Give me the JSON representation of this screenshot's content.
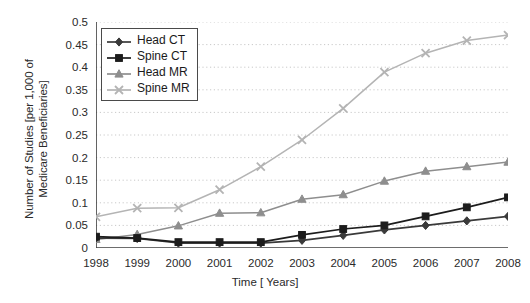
{
  "chart_data": {
    "type": "line",
    "title": "",
    "xlabel": "Time [ Years]",
    "ylabel": "Number of Studies [per 1,000 of Medicare Beneficiaries]",
    "ylabel_line1": "Number of Studies [per 1,000 of",
    "ylabel_line2": "Medicare Beneficiaries]",
    "x": [
      1998,
      1999,
      2000,
      2001,
      2002,
      2003,
      2004,
      2005,
      2006,
      2007,
      2008
    ],
    "categories": [
      "1998",
      "1999",
      "2000",
      "2001",
      "2002",
      "2003",
      "2004",
      "2005",
      "2006",
      "2007",
      "2008"
    ],
    "xlim": [
      1998,
      2008
    ],
    "ylim": [
      0,
      0.5
    ],
    "yticks": [
      0,
      0.05,
      0.1,
      0.15,
      0.2,
      0.25,
      0.3,
      0.35,
      0.4,
      0.45,
      0.5
    ],
    "ytick_labels": [
      "0",
      "0.05",
      "0.1",
      "0.15",
      "0.2",
      "0.25",
      "0.3",
      "0.35",
      "0.4",
      "0.45",
      "0.5"
    ],
    "grid": true,
    "grid_style": "dotted-horizontal",
    "legend_position": "top-left",
    "series": [
      {
        "name": "Head CT",
        "marker": "diamond",
        "color": "#3a3a3a",
        "values": [
          0.022,
          0.021,
          0.011,
          0.011,
          0.011,
          0.017,
          0.028,
          0.04,
          0.05,
          0.06,
          0.07
        ]
      },
      {
        "name": "Spine CT",
        "marker": "square",
        "color": "#1c1c1c",
        "values": [
          0.025,
          0.022,
          0.013,
          0.013,
          0.013,
          0.029,
          0.042,
          0.05,
          0.07,
          0.09,
          0.112
        ]
      },
      {
        "name": "Head MR",
        "marker": "triangle",
        "color": "#8e8e8e",
        "values": [
          0.019,
          0.03,
          0.049,
          0.077,
          0.078,
          0.108,
          0.118,
          0.148,
          0.17,
          0.18,
          0.19
        ]
      },
      {
        "name": "Spine MR",
        "marker": "cross",
        "color": "#b4b4b4",
        "values": [
          0.069,
          0.088,
          0.089,
          0.129,
          0.18,
          0.239,
          0.309,
          0.389,
          0.431,
          0.459,
          0.471
        ]
      }
    ]
  },
  "legend": {
    "items": [
      {
        "label": "Head CT"
      },
      {
        "label": "Spine CT"
      },
      {
        "label": "Head MR"
      },
      {
        "label": "Spine MR"
      }
    ]
  }
}
